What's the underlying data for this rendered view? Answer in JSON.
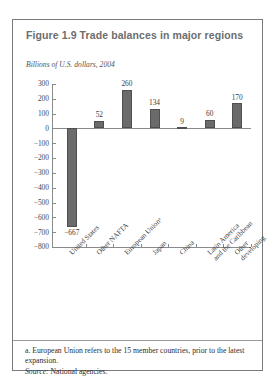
{
  "figure": {
    "title": "Figure 1.9  Trade balances in major regions",
    "subtitle": "Billions of U.S. dollars, 2004",
    "footnote": "a. European Union refers to the 15 member countries, prior to the latest expansion.",
    "source_label": "Source:",
    "source_text": " National agencies."
  },
  "chart_data": {
    "type": "bar",
    "title": "Figure 1.9  Trade balances in major regions",
    "subtitle": "Billions of U.S. dollars, 2004",
    "xlabel": "",
    "ylabel": "Billions of U.S. dollars, 2004",
    "ylim": [
      -800,
      300
    ],
    "ytick_step": 100,
    "grid": false,
    "legend": "none",
    "bar_color": "#6b6b6b",
    "categories": [
      "United States",
      "Other NAFTA",
      "European Unionᵃ",
      "Japan",
      "China",
      "Latin America\nand the Caribbean",
      "Other\ndeveloping"
    ],
    "values": [
      -667,
      52,
      260,
      134,
      9,
      60,
      170
    ],
    "value_labels": [
      "−667",
      "52",
      "260",
      "134",
      "9",
      "60",
      "170"
    ],
    "ytick_labels": [
      "300",
      "200",
      "100",
      "0",
      "−100",
      "−200",
      "−300",
      "−400",
      "−500",
      "−600",
      "−700",
      "−800"
    ],
    "ytick_values": [
      300,
      200,
      100,
      0,
      -100,
      -200,
      -300,
      -400,
      -500,
      -600,
      -700,
      -800
    ]
  }
}
